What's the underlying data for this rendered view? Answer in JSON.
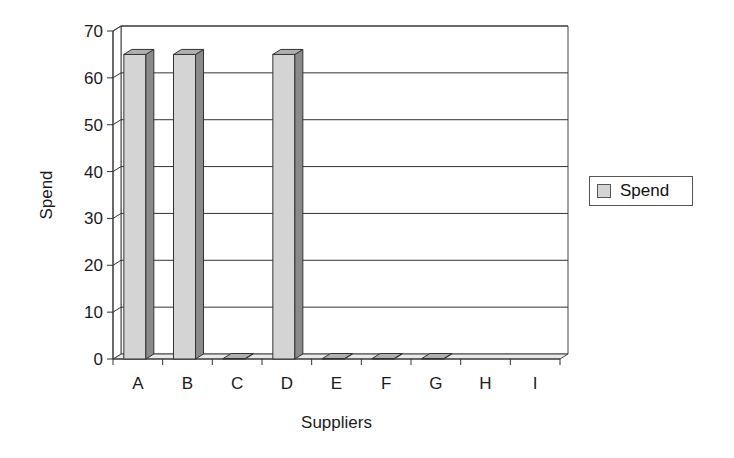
{
  "chart_data": {
    "type": "bar",
    "style": "3d-column",
    "title": "",
    "xlabel": "Suppliers",
    "ylabel": "Spend",
    "categories": [
      "A",
      "B",
      "C",
      "D",
      "E",
      "F",
      "G",
      "H",
      "I"
    ],
    "series": [
      {
        "name": "Spend",
        "values": [
          65,
          65,
          0,
          65,
          0,
          0,
          0,
          null,
          null
        ]
      }
    ],
    "ylim": [
      0,
      70
    ],
    "yticks": [
      0,
      10,
      20,
      30,
      40,
      50,
      60,
      70
    ],
    "grid": true,
    "legend": "right",
    "colors": {
      "bar_front": "#d4d4d4",
      "bar_side": "#8a8a8a",
      "bar_top": "#b0b0b0",
      "grid": "#333333"
    }
  },
  "legend": {
    "label": "Spend"
  }
}
